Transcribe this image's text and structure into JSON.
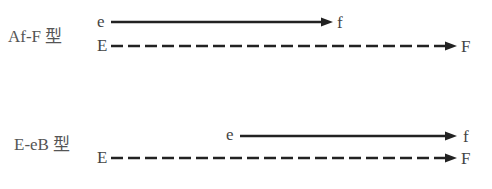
{
  "diagram": {
    "panels": [
      {
        "type_label": "Af-F 型",
        "upper": {
          "start": "e",
          "end": "f",
          "style": "solid"
        },
        "lower": {
          "start": "E",
          "end": "F",
          "style": "dashed"
        }
      },
      {
        "type_label": "E-eB 型",
        "upper": {
          "start": "e",
          "end": "f",
          "style": "solid"
        },
        "lower": {
          "start": "E",
          "end": "F",
          "style": "dashed"
        }
      }
    ]
  }
}
